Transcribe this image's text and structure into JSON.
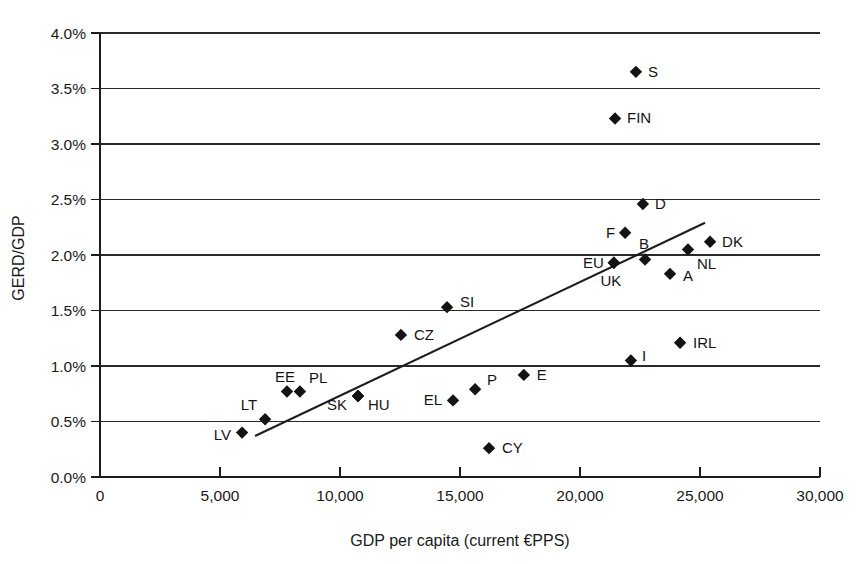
{
  "chart_data": {
    "type": "scatter",
    "title": "",
    "xlabel": "GDP per capita (current €PPS)",
    "ylabel": "GERD/GDP",
    "xlim": [
      0,
      30000
    ],
    "ylim": [
      0,
      4.0
    ],
    "grid": "horizontal",
    "legend": "none",
    "xticks": [
      0,
      5000,
      10000,
      15000,
      20000,
      25000,
      30000
    ],
    "xtick_labels": [
      "0",
      "5,000",
      "10,000",
      "15,000",
      "20,000",
      "25,000",
      "30,000"
    ],
    "yticks": [
      0.0,
      0.5,
      1.0,
      1.5,
      2.0,
      2.5,
      3.0,
      3.5,
      4.0
    ],
    "ytick_labels": [
      "0.0%",
      "0.5%",
      "1.0%",
      "1.5%",
      "2.0%",
      "2.5%",
      "3.0%",
      "3.5%",
      "4.0%"
    ],
    "points": [
      {
        "label": "S",
        "x": 22330,
        "y": 3.65,
        "lx": 12,
        "ly": 5,
        "anchor": "start"
      },
      {
        "label": "FIN",
        "x": 21460,
        "y": 3.23,
        "lx": 12,
        "ly": 5,
        "anchor": "start"
      },
      {
        "label": "D",
        "x": 22620,
        "y": 2.46,
        "lx": 12,
        "ly": 5,
        "anchor": "start"
      },
      {
        "label": "F",
        "x": 21880,
        "y": 2.2,
        "lx": -10,
        "ly": 5,
        "anchor": "end"
      },
      {
        "label": "DK",
        "x": 25420,
        "y": 2.12,
        "lx": 12,
        "ly": 5,
        "anchor": "start"
      },
      {
        "label": "B",
        "x": 22710,
        "y": 1.96,
        "lx": -1,
        "ly": -10,
        "anchor": "middle"
      },
      {
        "label": "NL",
        "x": 24500,
        "y": 2.05,
        "lx": 9,
        "ly": 20,
        "anchor": "start"
      },
      {
        "label": "EU",
        "x": 21410,
        "y": 1.93,
        "lx": -10,
        "ly": 5,
        "anchor": "end"
      },
      {
        "label": "UK",
        "x": 21410,
        "y": 1.93,
        "lx": -3,
        "ly": 23,
        "anchor": "middle"
      },
      {
        "label": "A",
        "x": 23750,
        "y": 1.83,
        "lx": 13,
        "ly": 7,
        "anchor": "start"
      },
      {
        "label": "SI",
        "x": 14460,
        "y": 1.53,
        "lx": 13,
        "ly": 0,
        "anchor": "start"
      },
      {
        "label": "CZ",
        "x": 12540,
        "y": 1.28,
        "lx": 13,
        "ly": 5,
        "anchor": "start"
      },
      {
        "label": "IRL",
        "x": 24170,
        "y": 1.21,
        "lx": 13,
        "ly": 5,
        "anchor": "start"
      },
      {
        "label": "I",
        "x": 22120,
        "y": 1.05,
        "lx": 11,
        "ly": 1,
        "anchor": "start"
      },
      {
        "label": "E",
        "x": 17660,
        "y": 0.92,
        "lx": 13,
        "ly": 5,
        "anchor": "start"
      },
      {
        "label": "EE",
        "x": 7790,
        "y": 0.77,
        "lx": -2,
        "ly": -10,
        "anchor": "middle"
      },
      {
        "label": "PL",
        "x": 8330,
        "y": 0.77,
        "lx": 9,
        "ly": -9,
        "anchor": "start"
      },
      {
        "label": "P",
        "x": 15630,
        "y": 0.79,
        "lx": 12,
        "ly": -4,
        "anchor": "start"
      },
      {
        "label": "HU",
        "x": 10750,
        "y": 0.73,
        "lx": 10,
        "ly": 14,
        "anchor": "start"
      },
      {
        "label": "SK",
        "x": 10750,
        "y": 0.73,
        "lx": -11,
        "ly": 14,
        "anchor": "end"
      },
      {
        "label": "EL",
        "x": 14710,
        "y": 0.69,
        "lx": -11,
        "ly": 5,
        "anchor": "end"
      },
      {
        "label": "LT",
        "x": 6880,
        "y": 0.52,
        "lx": -8,
        "ly": -9,
        "anchor": "end"
      },
      {
        "label": "LV",
        "x": 5920,
        "y": 0.4,
        "lx": -11,
        "ly": 7,
        "anchor": "end"
      },
      {
        "label": "CY",
        "x": 16210,
        "y": 0.26,
        "lx": 13,
        "ly": 5,
        "anchor": "start"
      }
    ],
    "trendline": {
      "x_start": 6460,
      "y_start": 0.37,
      "x_end": 25210,
      "y_end": 2.29
    }
  }
}
